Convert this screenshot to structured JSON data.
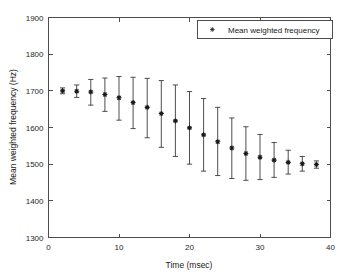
{
  "chart_data": {
    "type": "scatter",
    "title": "",
    "xlabel": "Time (msec)",
    "ylabel": "Mean weighted frequency (Hz)",
    "xlim": [
      0,
      40
    ],
    "ylim": [
      1300,
      1900
    ],
    "xticks": [
      0,
      10,
      20,
      30,
      40
    ],
    "yticks": [
      1300,
      1400,
      1500,
      1600,
      1700,
      1800,
      1900
    ],
    "grid": false,
    "legend": {
      "position": "top-right",
      "entries": [
        {
          "label": "Mean weighted frequency",
          "marker": "star-marker",
          "color": "#1a1a1a"
        }
      ]
    },
    "series": [
      {
        "name": "Mean weighted frequency",
        "marker": "star-marker",
        "color": "#1a1a1a",
        "x": [
          2,
          4,
          6,
          8,
          10,
          12,
          14,
          16,
          18,
          20,
          22,
          24,
          26,
          28,
          30,
          32,
          34,
          36,
          38
        ],
        "values": [
          1700,
          1699,
          1697,
          1690,
          1681,
          1668,
          1655,
          1638,
          1618,
          1599,
          1580,
          1561,
          1544,
          1529,
          1519,
          1511,
          1505,
          1501,
          1499
        ],
        "yerr_low": [
          1692,
          1682,
          1661,
          1644,
          1620,
          1597,
          1572,
          1546,
          1521,
          1500,
          1481,
          1469,
          1461,
          1456,
          1458,
          1464,
          1473,
          1481,
          1489
        ],
        "yerr_high": [
          1708,
          1716,
          1731,
          1735,
          1739,
          1737,
          1734,
          1728,
          1716,
          1698,
          1679,
          1655,
          1626,
          1602,
          1581,
          1559,
          1538,
          1521,
          1509
        ]
      }
    ]
  },
  "axis_ticks": {
    "x_labels": [
      "0",
      "10",
      "20",
      "30",
      "40"
    ],
    "y_labels": [
      "1300",
      "1400",
      "1500",
      "1600",
      "1700",
      "1800",
      "1900"
    ]
  },
  "labels": {
    "x_title": "Time (msec)",
    "y_title": "Mean weighted frequency (Hz)",
    "legend_text": "Mean weighted frequency"
  }
}
